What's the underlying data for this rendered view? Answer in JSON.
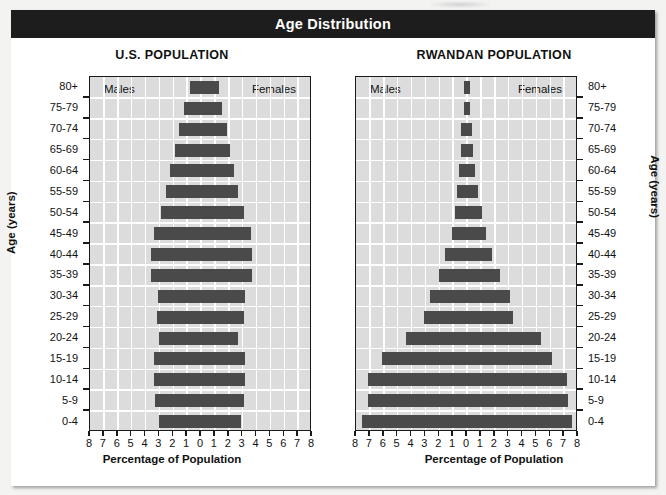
{
  "header": {
    "title": "Age Distribution"
  },
  "axis": {
    "xlabel": "Percentage of Population",
    "ylabel": "Age (years)",
    "xticks": [
      "8",
      "7",
      "6",
      "5",
      "4",
      "3",
      "2",
      "1",
      "0",
      "1",
      "2",
      "3",
      "4",
      "5",
      "6",
      "7",
      "8"
    ],
    "xlim": [
      -8,
      8
    ],
    "male_label": "Males",
    "female_label": "Females"
  },
  "chart_data": {
    "type": "bar",
    "subtype": "population-pyramid",
    "title": "Age Distribution",
    "xlabel": "Percentage of Population",
    "ylabel": "Age (years)",
    "xlim": [
      -8,
      8
    ],
    "grid": true,
    "legend_position": "in-plot-top",
    "categories": [
      "0-4",
      "5-9",
      "10-14",
      "15-19",
      "20-24",
      "25-29",
      "30-34",
      "35-39",
      "40-44",
      "45-49",
      "50-54",
      "55-59",
      "60-64",
      "65-69",
      "70-74",
      "75-79",
      "80+"
    ],
    "panels": [
      {
        "name": "U.S. POPULATION",
        "series": [
          {
            "name": "Males",
            "side": "left",
            "values": [
              3.0,
              3.3,
              3.4,
              3.4,
              3.0,
              3.2,
              3.1,
              3.6,
              3.6,
              3.4,
              2.9,
              2.5,
              2.2,
              1.9,
              1.6,
              1.2,
              0.8
            ]
          },
          {
            "name": "Females",
            "side": "right",
            "values": [
              2.9,
              3.1,
              3.2,
              3.2,
              2.7,
              3.1,
              3.2,
              3.7,
              3.7,
              3.6,
              3.1,
              2.7,
              2.4,
              2.1,
              1.9,
              1.5,
              1.3
            ]
          }
        ]
      },
      {
        "name": "RWANDAN POPULATION",
        "series": [
          {
            "name": "Males",
            "side": "left",
            "values": [
              7.6,
              7.1,
              7.1,
              6.1,
              4.4,
              3.1,
              2.7,
              2.0,
              1.6,
              1.1,
              0.9,
              0.7,
              0.6,
              0.45,
              0.4,
              0.25,
              0.2
            ]
          },
          {
            "name": "Females",
            "side": "right",
            "values": [
              7.6,
              7.3,
              7.2,
              6.1,
              5.3,
              3.3,
              3.1,
              2.4,
              1.8,
              1.4,
              1.1,
              0.8,
              0.6,
              0.45,
              0.35,
              0.25,
              0.2
            ]
          }
        ]
      }
    ]
  }
}
